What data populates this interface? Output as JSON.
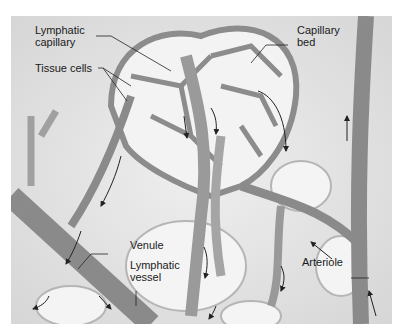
{
  "figure": {
    "labels": {
      "lymphatic_capillary_1": "Lymphatic",
      "lymphatic_capillary_2": "capillary",
      "tissue_cells": "Tissue cells",
      "capillary_bed_1": "Capillary",
      "capillary_bed_2": "bed",
      "venule": "Venule",
      "lymphatic_vessel_1": "Lymphatic",
      "lymphatic_vessel_2": "vessel",
      "arteriole": "Arteriole"
    },
    "colors": {
      "background": "#e6e6e6",
      "vessel": "#8a8a8a",
      "vessel_light": "#c8c8c8",
      "cell": "#f2f2f2",
      "arrow": "#222222"
    }
  }
}
